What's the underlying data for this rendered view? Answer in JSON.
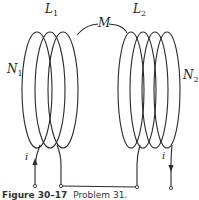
{
  "figure": {
    "coil1": {
      "inductance_label": "L",
      "inductance_sub": "1",
      "turns_label": "N",
      "turns_sub": "1",
      "loops": 3
    },
    "coil2": {
      "inductance_label": "L",
      "inductance_sub": "2",
      "turns_label": "N",
      "turns_sub": "2",
      "loops": 4
    },
    "mutual_label": "M",
    "current_left": "i",
    "current_right": "i",
    "caption_number": "Figure 30–17",
    "caption_text": "Problem 31."
  },
  "colors": {
    "line": "#2a2a2a",
    "background": "#ffffff"
  }
}
